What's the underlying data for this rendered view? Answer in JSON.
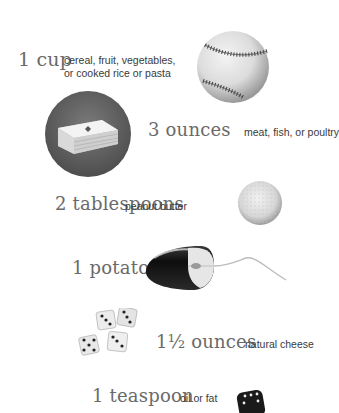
{
  "items": [
    {
      "amount": "1 cup",
      "description_line1": "cereal, fruit, vegetables,",
      "description_line2": "or cooked rice or pasta",
      "comparison_object": "baseball"
    },
    {
      "amount": "3 ounces",
      "description": "meat, fish, or poultry",
      "comparison_object": "deck of cards"
    },
    {
      "amount": "2 tablespoons",
      "description": "peanut butter",
      "comparison_object": "golf ball"
    },
    {
      "amount": "1 potato",
      "description": "",
      "comparison_object": "computer mouse"
    },
    {
      "amount": "1½ ounces",
      "description": "natural cheese",
      "comparison_object": "four dice"
    },
    {
      "amount": "1 teaspoon",
      "description": "oil or fat",
      "comparison_object": "one die"
    }
  ],
  "colors": {
    "amount_text": "#6a6a6a",
    "description_text": "#3a3a3a",
    "background": "#ffffff"
  }
}
